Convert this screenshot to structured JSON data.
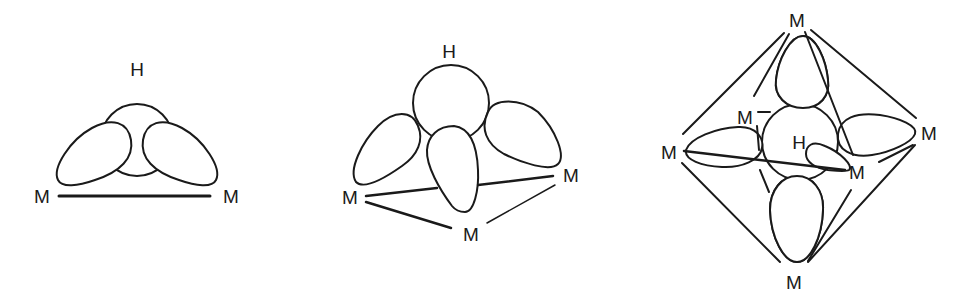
{
  "figure": {
    "panels": [
      {
        "id": "two-center",
        "description": "Hydrogen bridging two metal atoms (edge-bridging, μ2-H)",
        "labels": {
          "hydrogen": "H",
          "metals": [
            "M",
            "M"
          ]
        }
      },
      {
        "id": "three-center",
        "description": "Hydrogen capping a triangle of three metal atoms (face-capping, μ3-H)",
        "labels": {
          "hydrogen": "H",
          "metals": [
            "M",
            "M",
            "M"
          ]
        }
      },
      {
        "id": "octahedral",
        "description": "Interstitial hydrogen in an octahedron of six metal atoms (μ6-H)",
        "labels": {
          "hydrogen": "H",
          "metals": [
            "M",
            "M",
            "M",
            "M",
            "M",
            "M"
          ]
        }
      }
    ],
    "colors": {
      "line": "#1a1a1a",
      "background": "#ffffff"
    }
  }
}
